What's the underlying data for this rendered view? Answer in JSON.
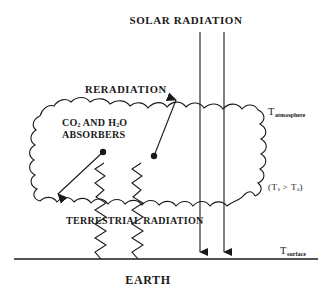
{
  "figure": {
    "background_color": "#ffffff",
    "stroke_color": "#1a1a1a",
    "width": 325,
    "height": 301
  },
  "labels": {
    "solar_radiation": "SOLAR RADIATION",
    "reradiation": "RERADIATION",
    "absorbers_line1": "CO",
    "absorbers_sub1": "2",
    "absorbers_mid": " AND H",
    "absorbers_sub2": "2",
    "absorbers_end": "O",
    "absorbers_line2": "ABSORBERS",
    "terrestrial_radiation": "TERRESTRIAL RADIATION",
    "earth": "EARTH",
    "t_atmosphere_base": "T",
    "t_atmosphere_sub": "atmosphere",
    "t_surface_base": "T",
    "t_surface_sub": "surface",
    "temp_relation_open": "(T",
    "temp_relation_sub1": "s",
    "temp_relation_mid": " > T",
    "temp_relation_sub2": "a",
    "temp_relation_close": ")"
  },
  "elements": {
    "solar_ray_left_x": 200,
    "solar_ray_right_x": 224,
    "solar_ray_top_y": 32,
    "solar_ray_bottom_y": 258,
    "earth_line_y": 259,
    "earth_line_start_x": 14,
    "earth_line_end_x": 318,
    "atmosphere_cloud_top_y": 100,
    "atmosphere_cloud_bottom_y": 200
  }
}
